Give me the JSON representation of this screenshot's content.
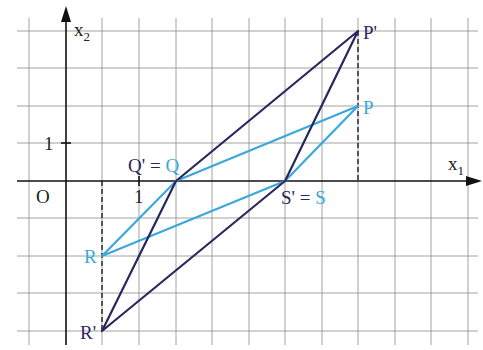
{
  "diagram": {
    "colors": {
      "grid": "#8a8a8a",
      "axis": "#111111",
      "original": "#3aa8dc",
      "image": "#2a2660",
      "label_dark": "#2a2660",
      "label_light": "#3aa8dc"
    },
    "axes": {
      "x_label": "x",
      "x_sub": "1",
      "y_label": "x",
      "y_sub": "2",
      "origin_label": "O",
      "x_tick_label": "1",
      "y_tick_label": "1"
    },
    "points": {
      "P": {
        "label": "P",
        "coords": [
          8,
          2
        ]
      },
      "Q": {
        "label": "Q",
        "coords": [
          3,
          0
        ]
      },
      "R": {
        "label": "R",
        "coords": [
          1,
          -2
        ]
      },
      "S": {
        "label": "S",
        "coords": [
          6,
          0
        ]
      },
      "P_prime": {
        "label": "P'",
        "coords": [
          8,
          4
        ]
      },
      "Q_prime": {
        "label": "Q'",
        "coords": [
          3,
          0
        ]
      },
      "R_prime": {
        "label": "R'",
        "coords": [
          1,
          -4
        ]
      },
      "S_prime": {
        "label": "S'",
        "coords": [
          6,
          0
        ]
      }
    },
    "labels": {
      "q_eq_prime": "Q'",
      "q_eq_sign": " = ",
      "q_eq_orig": "Q",
      "s_eq_prime": "S'",
      "s_eq_sign": " = ",
      "s_eq_orig": "S",
      "p": "P",
      "p_prime": "P'",
      "r": "R",
      "r_prime": "R'"
    },
    "quadrilaterals": {
      "original": [
        "P",
        "Q",
        "R",
        "S"
      ],
      "image": [
        "P'",
        "Q'",
        "R'",
        "S'"
      ]
    }
  }
}
